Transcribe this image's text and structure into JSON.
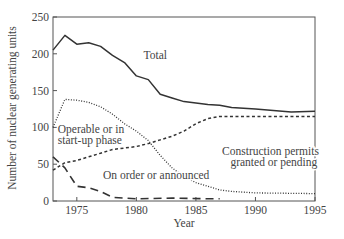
{
  "chart_data": {
    "type": "line",
    "title": "",
    "xlabel": "Year",
    "ylabel": "Number of nuclear generating units",
    "xlim": [
      1973,
      1995
    ],
    "ylim": [
      0,
      250
    ],
    "x_ticks": [
      1975,
      1980,
      1985,
      1990,
      1995
    ],
    "y_ticks": [
      0,
      50,
      100,
      150,
      200,
      250
    ],
    "grid": false,
    "legend": "none (inline annotations)",
    "series": [
      {
        "name": "Total",
        "style": "solid",
        "x": [
          1973,
          1974,
          1975,
          1976,
          1977,
          1978,
          1979,
          1980,
          1981,
          1982,
          1983,
          1984,
          1985,
          1986,
          1987,
          1988,
          1990,
          1993,
          1995
        ],
        "values": [
          205,
          225,
          213,
          215,
          210,
          198,
          188,
          170,
          165,
          145,
          140,
          135,
          133,
          131,
          130,
          127,
          125,
          121,
          122
        ]
      },
      {
        "name": "Operable or in start-up phase",
        "style": "dashed",
        "x": [
          1973,
          1974,
          1975,
          1976,
          1977,
          1978,
          1979,
          1980,
          1981,
          1982,
          1983,
          1984,
          1985,
          1986,
          1987,
          1990,
          1995
        ],
        "values": [
          42,
          52,
          55,
          60,
          65,
          70,
          72,
          74,
          78,
          83,
          88,
          95,
          105,
          112,
          115,
          115,
          115
        ]
      },
      {
        "name": "Construction permits granted or pending",
        "style": "dotted",
        "x": [
          1973,
          1974,
          1975,
          1976,
          1977,
          1978,
          1979,
          1980,
          1981,
          1982,
          1983,
          1984,
          1985,
          1986,
          1987,
          1988,
          1990,
          1995
        ],
        "values": [
          100,
          138,
          137,
          134,
          128,
          118,
          105,
          95,
          82,
          62,
          45,
          33,
          25,
          20,
          15,
          13,
          11,
          10
        ]
      },
      {
        "name": "On order or announced",
        "style": "long-dashed",
        "x": [
          1973,
          1974,
          1975,
          1976,
          1977,
          1978,
          1980,
          1983,
          1986,
          1987
        ],
        "values": [
          60,
          45,
          20,
          18,
          13,
          5,
          3,
          4,
          3,
          3
        ]
      }
    ],
    "annotations": [
      {
        "text": "Total",
        "x": 1980.6,
        "y": 193
      },
      {
        "text": "Operable or in",
        "x": 1973.4,
        "y": 93
      },
      {
        "text": "start-up phase",
        "x": 1973.4,
        "y": 77
      },
      {
        "text": "On order or announced",
        "x": 1977.2,
        "y": 30
      },
      {
        "text": "Construction permits",
        "x": 1987.2,
        "y": 62
      },
      {
        "text": "granted or pending",
        "x": 1987.9,
        "y": 47
      }
    ]
  },
  "labels": {
    "xlabel": "Year",
    "ylabel": "Number of nuclear generating units"
  }
}
